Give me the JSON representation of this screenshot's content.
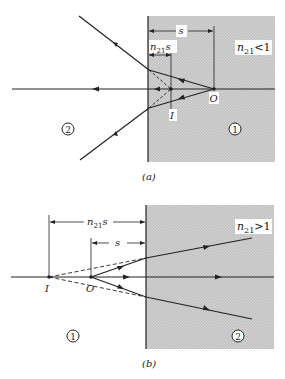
{
  "figure": {
    "panel_a": {
      "caption": "(a)",
      "condition_label": "n21 <1",
      "condition_main": "n",
      "condition_sub": "21",
      "condition_rest": "<1",
      "dimension_s": "s",
      "dimension_n21s_main": "n",
      "dimension_n21s_sub": "21",
      "dimension_n21s_rest": "s",
      "point_object": "O",
      "point_image": "I",
      "medium_left": "2",
      "medium_right": "1"
    },
    "panel_b": {
      "caption": "(b)",
      "condition_main": "n",
      "condition_sub": "21",
      "condition_rest": ">1",
      "dimension_s": "s",
      "dimension_n21s_main": "n",
      "dimension_n21s_sub": "21",
      "dimension_n21s_rest": "s",
      "point_object": "O",
      "point_image": "I",
      "medium_left": "1",
      "medium_right": "2"
    },
    "colors": {
      "shade": "#c8c8c8",
      "line": "#222222",
      "background": "#ffffff"
    }
  }
}
